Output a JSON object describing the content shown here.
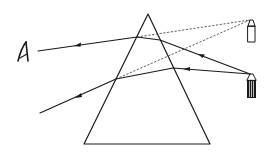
{
  "diagram": {
    "title": "Light rays refracted through a triangular prism",
    "colors": {
      "line": "#1a1a1a",
      "dashed": "#333333",
      "background": "#ffffff"
    },
    "elements": {
      "eye": {
        "label": "eye",
        "icon": "eye-icon"
      },
      "top_object": {
        "label": "virtual image of source",
        "icon": "candle-outline-icon"
      },
      "bottom_object": {
        "label": "real light source",
        "icon": "candle-filled-icon"
      },
      "prism": {
        "label": "triangular prism"
      },
      "rays": [
        {
          "label": "upper refracted ray",
          "style": "solid"
        },
        {
          "label": "lower refracted ray",
          "style": "solid"
        },
        {
          "label": "upper apparent ray",
          "style": "dashed"
        },
        {
          "label": "lower apparent ray",
          "style": "dashed"
        }
      ]
    }
  }
}
